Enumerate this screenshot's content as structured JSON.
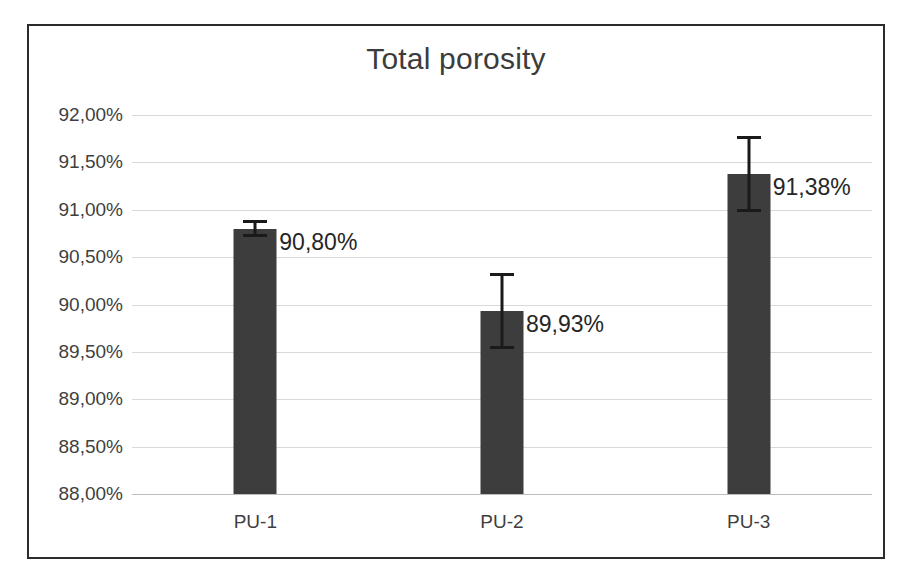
{
  "chart_data": {
    "type": "bar",
    "title": "Total porosity",
    "xlabel": "",
    "ylabel": "",
    "categories": [
      "PU-1",
      "PU-2",
      "PU-3"
    ],
    "values": [
      90.8,
      89.93,
      91.38
    ],
    "value_labels": [
      "90,80%",
      "89,93%",
      "91,38%"
    ],
    "errors": [
      0.09,
      0.4,
      0.4
    ],
    "error_upper": [
      90.89,
      90.33,
      91.78
    ],
    "error_lower": [
      90.71,
      89.53,
      90.98
    ],
    "ylim": [
      88.0,
      92.0
    ],
    "ytick_values": [
      92.0,
      91.5,
      91.0,
      90.5,
      90.0,
      89.5,
      89.0,
      88.5,
      88.0
    ],
    "ytick_labels": [
      "92,00%",
      "91,50%",
      "91,00%",
      "90,50%",
      "90,00%",
      "89,50%",
      "89,00%",
      "88,50%",
      "88,00%"
    ],
    "grid": true,
    "legend": false,
    "legend_position": "none",
    "bar_color": "#3d3d3d",
    "gridline_color": "#d9d9d9",
    "error_bar_color": "#1a1a1a",
    "frame_color": "#2b2b2b",
    "background_color": "#ffffff",
    "decimal_separator": ","
  }
}
